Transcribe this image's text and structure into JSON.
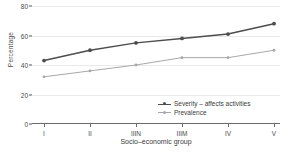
{
  "chart_data": {
    "type": "line",
    "title": "",
    "xlabel": "Socio–economic group",
    "ylabel": "Percentage",
    "categories": [
      "I",
      "II",
      "IIIN",
      "IIIM",
      "IV",
      "V"
    ],
    "yticks": [
      0,
      20,
      40,
      60,
      80
    ],
    "ylim": [
      0,
      80
    ],
    "grid": true,
    "legend_position": "bottom-right",
    "series": [
      {
        "name": "Severity – affects activities",
        "color": "#4d4d4d",
        "marker": "circle",
        "values": [
          43,
          50,
          55,
          58,
          61,
          68
        ]
      },
      {
        "name": "Prevalence",
        "color": "#a8a8a8",
        "marker": "circle",
        "values": [
          32,
          36,
          40,
          45,
          45,
          50
        ]
      }
    ]
  },
  "axis": {
    "y_title": "Percentage",
    "x_title": "Socio–economic group",
    "y_tick_labels": [
      "80",
      "60",
      "40",
      "20",
      "0"
    ],
    "x_tick_labels": [
      "I",
      "II",
      "IIIN",
      "IIIM",
      "IV",
      "V"
    ]
  },
  "legend": {
    "entries": [
      {
        "label": "Severity – affects activities"
      },
      {
        "label": "Prevalence"
      }
    ]
  },
  "colors": {
    "severity": "#4d4d4d",
    "prevalence": "#a8a8a8",
    "grid": "#e9e9e9",
    "axis": "#6a6a6a",
    "text": "#3a3a3a",
    "background": "#ffffff"
  }
}
